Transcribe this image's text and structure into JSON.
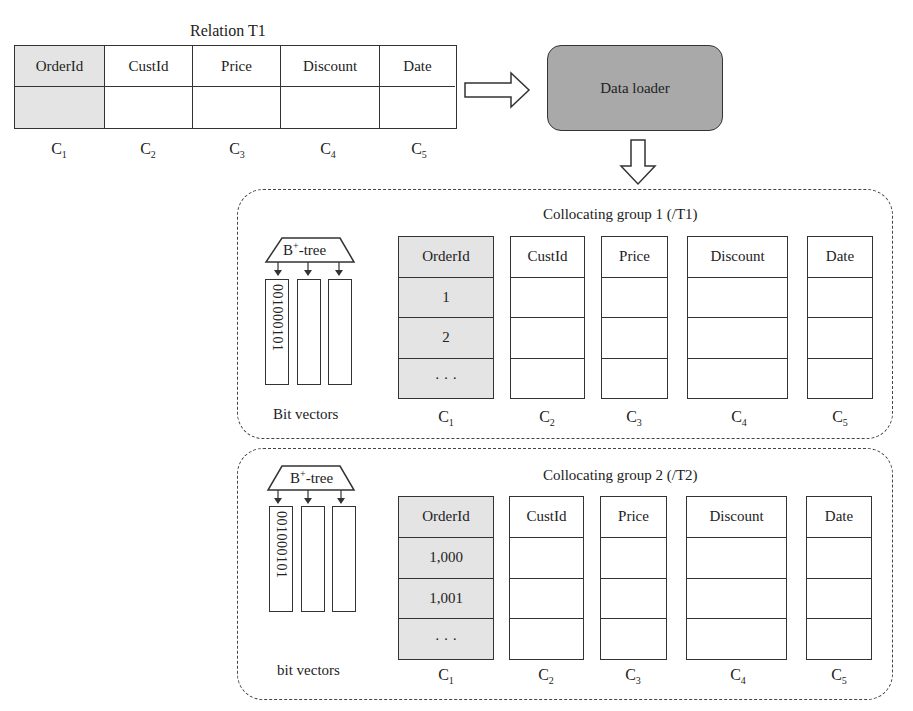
{
  "relation": {
    "title": "Relation T1",
    "columns": [
      "OrderId",
      "CustId",
      "Price",
      "Discount",
      "Date"
    ],
    "column_labels": [
      "C",
      "C",
      "C",
      "C",
      "C"
    ],
    "column_subscripts": [
      "1",
      "2",
      "3",
      "4",
      "5"
    ],
    "shaded_column": "OrderId"
  },
  "loader": {
    "label": "Data loader",
    "fill": "#a9a9a9"
  },
  "groups": [
    {
      "title": "Collocating group 1 (/T1)",
      "index_label": "B",
      "index_sup": "+",
      "index_suffix": "-tree",
      "bit_vector_text": "001000101",
      "bit_vectors_label": "Bit vectors",
      "columns": [
        "OrderId",
        "CustId",
        "Price",
        "Discount",
        "Date"
      ],
      "orderid_values": [
        "1",
        "2",
        "· · ·"
      ],
      "subscripts": [
        "1",
        "2",
        "3",
        "4",
        "5"
      ]
    },
    {
      "title": "Collocating group 2 (/T2)",
      "index_label": "B",
      "index_sup": "+",
      "index_suffix": "-tree",
      "bit_vector_text": "001000101",
      "bit_vectors_label": "bit vectors",
      "columns": [
        "OrderId",
        "CustId",
        "Price",
        "Discount",
        "Date"
      ],
      "orderid_values": [
        "1,000",
        "1,001",
        "· · ·"
      ],
      "subscripts": [
        "1",
        "2",
        "3",
        "4",
        "5"
      ]
    }
  ],
  "colors": {
    "shade": "#e4e4e4",
    "line": "#333333"
  }
}
